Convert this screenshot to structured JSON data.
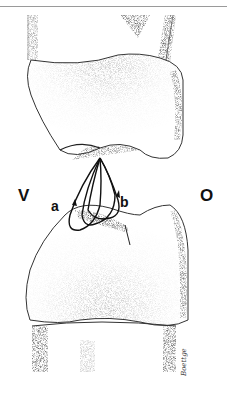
{
  "figure": {
    "labels": {
      "left": "V",
      "right": "O",
      "loop_a": "a",
      "loop_b": "b"
    },
    "signature": "Boettge",
    "colors": {
      "ink": "#111111",
      "stipple": "#555555",
      "background": "#ffffff",
      "rule": "#9a9a9a"
    }
  }
}
